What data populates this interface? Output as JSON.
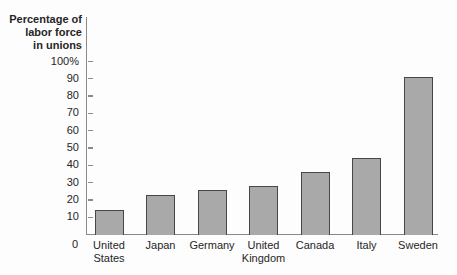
{
  "chart_data": {
    "type": "bar",
    "title": "",
    "xlabel": "",
    "ylabel": "Percentage of labor force in unions",
    "ylabel_lines": [
      "Percentage of",
      "labor force",
      "in unions"
    ],
    "categories": [
      "United States",
      "Japan",
      "Germany",
      "United Kingdom",
      "Canada",
      "Italy",
      "Sweden"
    ],
    "category_display": [
      "United\nStates",
      "Japan",
      "Germany",
      "United\nKingdom",
      "Canada",
      "Italy",
      "Sweden"
    ],
    "values": [
      14,
      23,
      26,
      28,
      36,
      44,
      91
    ],
    "ylim": [
      0,
      100
    ],
    "y_ticks": [
      {
        "label": "100%",
        "value": 100
      },
      {
        "label": "90",
        "value": 90
      },
      {
        "label": "80",
        "value": 80
      },
      {
        "label": "70",
        "value": 70
      },
      {
        "label": "60",
        "value": 60
      },
      {
        "label": "50",
        "value": 50
      },
      {
        "label": "40",
        "value": 40
      },
      {
        "label": "30",
        "value": 30
      },
      {
        "label": "20",
        "value": 20
      },
      {
        "label": "10",
        "value": 10
      }
    ],
    "origin_label": "0",
    "grid": false,
    "legend": "none",
    "colors": {
      "bar_fill": "#a9a9a9",
      "bar_border": "#474747",
      "axis": "#8a8a8a",
      "text": "#262626",
      "background": "#fdfdfd"
    }
  }
}
